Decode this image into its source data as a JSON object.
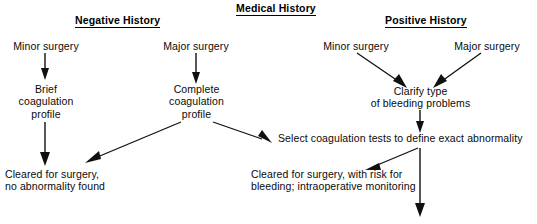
{
  "title": {
    "text": "Medical History"
  },
  "columns": [
    {
      "id": "negative",
      "heading": "Negative History"
    },
    {
      "id": "positive",
      "heading": "Positive History"
    }
  ],
  "nodes": {
    "minor_surgery_left": "Minor surgery",
    "major_surgery_left": "Major surgery",
    "brief_profile": "Brief\ncoagulation\nprofile",
    "complete_profile": "Complete\ncoagulation\nprofile",
    "cleared_no_abnormality": "Cleared for surgery,\nno abnormality found",
    "minor_surgery_right": "Minor surgery",
    "major_surgery_right": "Major surgery",
    "clarify_type": "Clarify type\nof bleeding problems",
    "select_tests": "Select coagulation tests to define exact abnormality",
    "cleared_with_risk": "Cleared for surgery, with risk for\nbleeding; intraoperative monitoring"
  },
  "edges": [
    {
      "id": "minor-left-to-brief",
      "from": "minor_surgery_left",
      "to": "brief_profile",
      "shape": "vertical"
    },
    {
      "id": "major-left-to-complete",
      "from": "major_surgery_left",
      "to": "complete_profile",
      "shape": "vertical"
    },
    {
      "id": "brief-to-cleared",
      "from": "brief_profile",
      "to": "cleared_no_abnormality",
      "shape": "vertical"
    },
    {
      "id": "complete-to-cleared",
      "from": "complete_profile",
      "to": "cleared_no_abnormality",
      "shape": "diagonal-down-left"
    },
    {
      "id": "complete-to-select",
      "from": "complete_profile",
      "to": "select_tests",
      "shape": "diagonal-down-right"
    },
    {
      "id": "minor-right-to-clarify",
      "from": "minor_surgery_right",
      "to": "clarify_type",
      "shape": "diagonal-down-right"
    },
    {
      "id": "major-right-to-clarify",
      "from": "major_surgery_right",
      "to": "clarify_type",
      "shape": "diagonal-down-left"
    },
    {
      "id": "clarify-to-select",
      "from": "clarify_type",
      "to": "select_tests",
      "shape": "vertical"
    },
    {
      "id": "select-to-cleared-risk",
      "from": "select_tests",
      "to": "cleared_with_risk",
      "shape": "diagonal-down-left"
    },
    {
      "id": "select-to-bottom",
      "from": "select_tests",
      "to": "",
      "shape": "vertical"
    }
  ],
  "colors": {
    "background": "#ffffff",
    "text": "#0a0a0a",
    "stroke": "#101010"
  }
}
